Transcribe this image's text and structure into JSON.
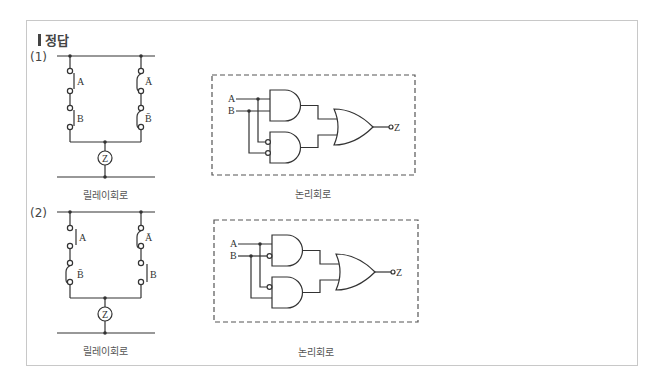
{
  "title": "정답",
  "problems": [
    {
      "number": "(1)",
      "relay": {
        "caption": "릴레이회로",
        "left_branch": [
          {
            "label": "A",
            "type": "NO"
          },
          {
            "label": "B",
            "type": "NO"
          }
        ],
        "right_branch": [
          {
            "label": "Ā",
            "type": "NC"
          },
          {
            "label": "B̄",
            "type": "NC"
          }
        ],
        "output": "Z"
      },
      "logic": {
        "caption": "논리회로",
        "inputs": [
          "A",
          "B"
        ],
        "gates": [
          {
            "type": "AND",
            "inputs": [
              "A",
              "B"
            ]
          },
          {
            "type": "AND",
            "inputs": [
              "NOT A",
              "NOT B"
            ]
          },
          {
            "type": "OR",
            "inputs": [
              "AND1",
              "AND2"
            ]
          }
        ],
        "output": "Z"
      }
    },
    {
      "number": "(2)",
      "relay": {
        "caption": "릴레이회로",
        "left_branch": [
          {
            "label": "A",
            "type": "NO"
          },
          {
            "label": "B̄",
            "type": "NC"
          }
        ],
        "right_branch": [
          {
            "label": "Ā",
            "type": "NC"
          },
          {
            "label": "B",
            "type": "NO"
          }
        ],
        "output": "Z"
      },
      "logic": {
        "caption": "논리회로",
        "inputs": [
          "A",
          "B"
        ],
        "gates": [
          {
            "type": "AND",
            "inputs": [
              "A",
              "NOT B"
            ]
          },
          {
            "type": "AND",
            "inputs": [
              "NOT A",
              "B"
            ]
          },
          {
            "type": "OR",
            "inputs": [
              "AND1",
              "AND2"
            ]
          }
        ],
        "output": "Z"
      }
    }
  ],
  "colors": {
    "line": "#333333",
    "frame": "#c8c8c8",
    "dash": "#555555"
  }
}
